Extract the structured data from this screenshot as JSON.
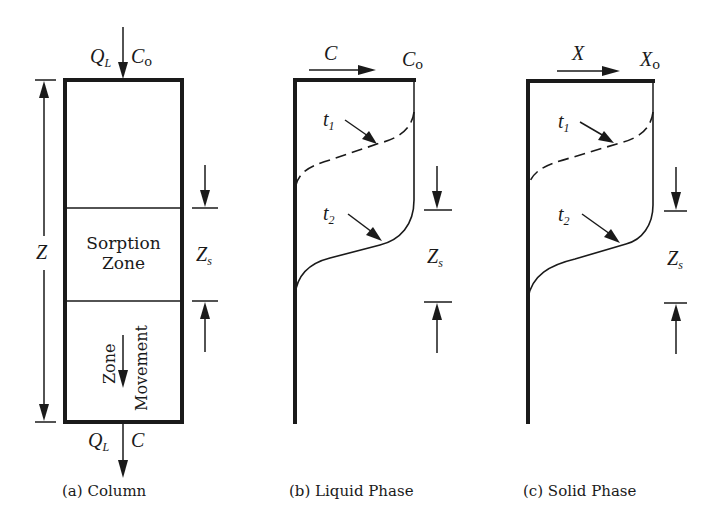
{
  "figure": {
    "panels": [
      {
        "id": "a",
        "caption": "(a)  Column",
        "inlet": {
          "flow": "Q",
          "flow_sub": "L",
          "conc": "C",
          "conc_sub": "o"
        },
        "outlet": {
          "flow": "Q",
          "flow_sub": "L",
          "conc": "C"
        },
        "height_label": "Z",
        "zone_label_line1": "Sorption",
        "zone_label_line2": "Zone",
        "movement_label_line1": "Zone",
        "movement_label_line2": "Movement",
        "zone_height_label": "Z",
        "zone_height_sub": "s"
      },
      {
        "id": "b",
        "caption": "(b)  Liquid Phase",
        "axis_label": "C",
        "axis_max": "C",
        "axis_max_sub": "o",
        "curves": [
          {
            "label": "t",
            "sub": "1",
            "style": "dashed"
          },
          {
            "label": "t",
            "sub": "2",
            "style": "solid"
          }
        ],
        "zone_height_label": "Z",
        "zone_height_sub": "s"
      },
      {
        "id": "c",
        "caption": "(c)  Solid Phase",
        "axis_label": "X",
        "axis_max": "X",
        "axis_max_sub": "o",
        "curves": [
          {
            "label": "t",
            "sub": "1",
            "style": "dashed"
          },
          {
            "label": "t",
            "sub": "2",
            "style": "solid"
          }
        ],
        "zone_height_label": "Z",
        "zone_height_sub": "s"
      }
    ],
    "colors": {
      "ink": "#1a1a1a",
      "background": "#ffffff"
    }
  }
}
